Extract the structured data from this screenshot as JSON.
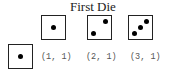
{
  "title": "First Die",
  "first_die_faces": [
    {
      "value": 1,
      "pips": 1
    },
    {
      "value": 2,
      "pips": 2
    },
    {
      "value": 3,
      "pips": 3
    }
  ],
  "second_die_faces": [
    {
      "value": 1,
      "pips": 1
    }
  ],
  "outcome_labels": [
    "(1, 1)",
    "(2, 1)",
    "(3, 1)"
  ],
  "colors": {
    "die_border": "#222222",
    "pip": "#000000",
    "label_text": "#555555",
    "title_text": "#222222"
  }
}
